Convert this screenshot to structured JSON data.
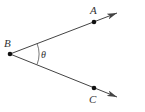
{
  "diagram": {
    "type": "angle",
    "colors": {
      "stroke": "#444444",
      "point": "#111111",
      "text": "#333333",
      "background": "#ffffff"
    },
    "vertex": {
      "label": "B",
      "x": 10,
      "y": 54
    },
    "points": [
      {
        "label": "A",
        "x": 94,
        "y": 22
      },
      {
        "label": "C",
        "x": 94,
        "y": 88
      }
    ],
    "rays": [
      {
        "from": "B",
        "through": "A",
        "tip": {
          "x": 117,
          "y": 13
        }
      },
      {
        "from": "B",
        "through": "C",
        "tip": {
          "x": 117,
          "y": 97
        }
      }
    ],
    "angle": {
      "label": "θ",
      "at": "B",
      "between": [
        "A",
        "C"
      ]
    }
  }
}
